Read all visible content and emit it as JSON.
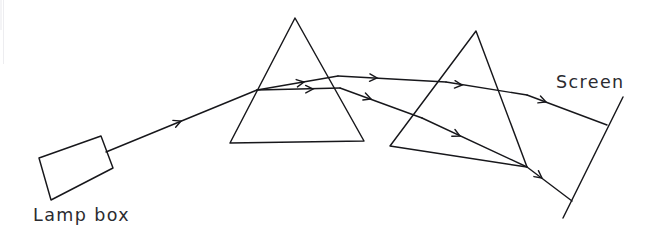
{
  "figure": {
    "kind": "optics-ray-diagram",
    "background_color": "#ffffff",
    "ink_color": "#17171b",
    "text_color": "#2b2b30",
    "width": 651,
    "height": 230
  },
  "labels": {
    "lamp_box": "Lamp box",
    "screen": "Screen"
  },
  "components": {
    "lamp_box": {
      "name": "Lamp box",
      "shape": "rotated-rectangle",
      "points": "39,158 101,136 113,168 51,200"
    },
    "prism_one": {
      "name": "First prism",
      "shape": "triangle",
      "points": "295,18 230,143 364,141"
    },
    "prism_two": {
      "name": "Second prism",
      "shape": "triangle",
      "points": "476,31 390,146 527,167"
    },
    "screen": {
      "name": "Screen",
      "shape": "line",
      "path": "M 623,97 L 563,218"
    }
  },
  "rays": {
    "incident": {
      "name": "Incident beam from lamp box to first prism",
      "path": "M 106,152 L 257,90",
      "arrows": [
        {
          "x": 181,
          "y": 121,
          "angle": -22.3
        }
      ]
    },
    "prism_one_internal_upper": {
      "name": "Upper refracted ray inside first prism",
      "path": "M 257,90 L 338,76",
      "arrows": [
        {
          "x": 304,
          "y": 82,
          "angle": -9.8
        }
      ]
    },
    "prism_one_internal_lower": {
      "name": "Lower refracted ray inside first prism",
      "path": "M 257,90 L 340,88",
      "arrows": [
        {
          "x": 313,
          "y": 89,
          "angle": -1.4
        }
      ]
    },
    "between_upper": {
      "name": "Upper beam from first prism into second prism",
      "path": "M 338,76 L 446,82",
      "arrows": [
        {
          "x": 377,
          "y": 78,
          "angle": 3.2
        },
        {
          "x": 462,
          "y": 85,
          "angle": 5.0
        }
      ]
    },
    "between_upper_tail": {
      "name": "Upper beam continuing through second prism left face",
      "path": "M 446,82 L 527,95"
    },
    "between_lower": {
      "name": "Lower beam from first prism descending to second prism",
      "path": "M 340,88 L 422,118",
      "arrows": [
        {
          "x": 371,
          "y": 99,
          "angle": 20.1
        }
      ]
    },
    "prism_two_internal_lower": {
      "name": "Lower beam refracted inside second prism",
      "path": "M 422,118 L 527,167",
      "arrows": [
        {
          "x": 460,
          "y": 136,
          "angle": 25.0
        }
      ]
    },
    "exit_upper": {
      "name": "Upper exit beam to screen",
      "path": "M 527,95 L 607,125",
      "arrows": [
        {
          "x": 546,
          "y": 102,
          "angle": 20.6
        }
      ]
    },
    "exit_lower": {
      "name": "Lower exit beam to screen",
      "path": "M 527,167 L 572,201",
      "arrows": [
        {
          "x": 542,
          "y": 178,
          "angle": 37.0
        }
      ]
    }
  },
  "geometry": {
    "screen_top": {
      "x": 623,
      "y": 97
    },
    "screen_bottom": {
      "x": 563,
      "y": 218
    },
    "upper_spot": {
      "x": 607,
      "y": 125
    },
    "lower_spot": {
      "x": 572,
      "y": 201
    }
  },
  "label_positions": {
    "lamp_box": {
      "x": 33,
      "y": 221
    },
    "screen": {
      "x": 556,
      "y": 88
    }
  }
}
